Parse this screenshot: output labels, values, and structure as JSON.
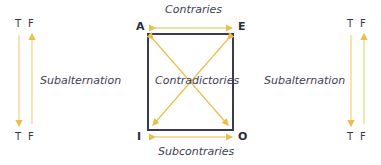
{
  "diagram": {
    "corners": {
      "a": "A",
      "e": "E",
      "i": "I",
      "o": "O"
    },
    "relations": {
      "top": "Contraries",
      "bottom": "Subcontraries",
      "diagonals": "Contradictories",
      "left": "Subalternation",
      "right": "Subalternation"
    },
    "truth_columns": {
      "left": {
        "top_t": "T",
        "top_f": "F",
        "bottom_t": "T",
        "bottom_f": "F"
      },
      "right": {
        "top_t": "T",
        "top_f": "F",
        "bottom_t": "T",
        "bottom_f": "F"
      }
    },
    "colors": {
      "arrow": "#e8c04a",
      "square": "#3a3a55",
      "text": "#3e3e55"
    }
  }
}
